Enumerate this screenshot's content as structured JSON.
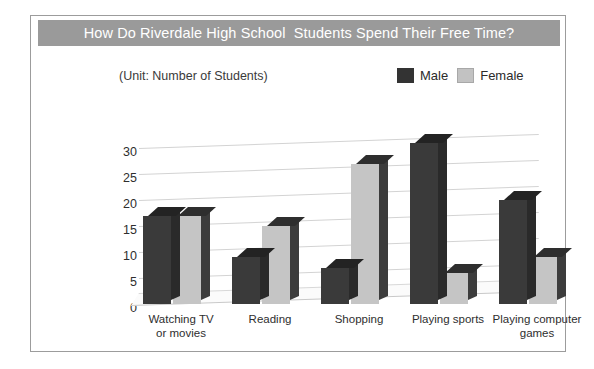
{
  "chart_data": {
    "type": "bar",
    "title": "How Do Riverdale High School  Students Spend Their Free Time?",
    "subtitle": "(Unit: Number of Students)",
    "categories": [
      "Watching TV\nor movies",
      "Reading",
      "Shopping",
      "Playing sports",
      "Playing computer\ngames"
    ],
    "series": [
      {
        "name": "Male",
        "values": [
          17,
          9,
          7,
          31,
          20
        ],
        "color": "#3a3a3a"
      },
      {
        "name": "Female",
        "values": [
          17,
          15,
          27,
          6,
          9
        ],
        "color": "#c5c5c5"
      }
    ],
    "xlabel": "",
    "ylabel": "",
    "ylim": [
      0,
      32
    ],
    "yticks": [
      0,
      5,
      10,
      15,
      20,
      25,
      30
    ],
    "grid": true,
    "legend_position": "top-right",
    "style": "3d-column"
  },
  "colors": {
    "title_bar": "#9a9a9a",
    "title_text": "#ffffff",
    "frame_border": "#9c9c9c",
    "gridline": "#d3d3d3",
    "male": "#3a3a3a",
    "female": "#c5c5c5"
  }
}
